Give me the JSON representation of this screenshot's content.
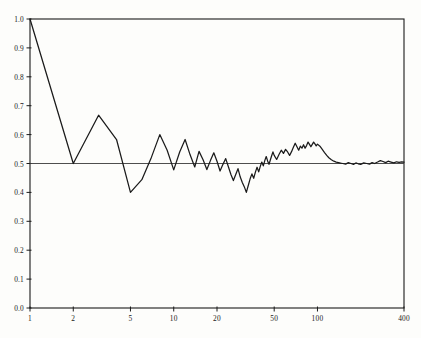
{
  "chart_data": {
    "type": "line",
    "title": "",
    "subtitle": "",
    "xlabel": "",
    "ylabel": "",
    "xscale": "log",
    "yscale": "linear",
    "xlim": [
      1,
      400
    ],
    "ylim": [
      0.0,
      1.0
    ],
    "grid": false,
    "legend": null,
    "legend_position": "none",
    "line_color": "#1a1a1a",
    "reference_line": {
      "name": "limit-line",
      "orientation": "horizontal",
      "y": 0.5,
      "color": "#3a3a3a"
    },
    "xticks": [
      1,
      2,
      5,
      10,
      20,
      50,
      100,
      400
    ],
    "xtick_labels": [
      "1",
      "2",
      "5",
      "10",
      "20",
      "50",
      "100",
      "400"
    ],
    "yticks": [
      0.0,
      0.1,
      0.2,
      0.3,
      0.4,
      0.5,
      0.6,
      0.7,
      0.8,
      0.9,
      1.0
    ],
    "ytick_labels": [
      "0.0",
      "0.1",
      "0.2",
      "0.3",
      "0.4",
      "0.5",
      "0.6",
      "0.7",
      "0.8",
      "0.9",
      "1.0"
    ],
    "series": [
      {
        "name": "relative-frequency",
        "x": [
          1,
          2,
          3,
          4,
          5,
          6,
          7,
          8,
          9,
          10,
          11,
          12,
          13,
          14,
          15,
          16,
          17,
          18,
          19,
          20,
          21,
          22,
          23,
          24,
          25,
          26,
          27,
          28,
          29,
          30,
          31,
          32,
          33,
          34,
          35,
          36,
          37,
          38,
          39,
          40,
          41,
          42,
          43,
          44,
          45,
          46,
          47,
          48,
          49,
          50,
          52,
          54,
          56,
          58,
          60,
          62,
          64,
          66,
          68,
          70,
          72,
          74,
          76,
          78,
          80,
          82,
          84,
          86,
          88,
          90,
          92,
          94,
          96,
          98,
          100,
          104,
          108,
          112,
          116,
          120,
          125,
          130,
          135,
          140,
          145,
          150,
          157,
          164,
          171,
          178,
          185,
          192,
          200,
          210,
          220,
          230,
          240,
          250,
          262,
          274,
          286,
          298,
          310,
          325,
          340,
          355,
          370,
          385,
          400
        ],
        "y": [
          1.0,
          0.5,
          0.667,
          0.583,
          0.4,
          0.444,
          0.522,
          0.6,
          0.546,
          0.478,
          0.54,
          0.583,
          0.53,
          0.488,
          0.542,
          0.513,
          0.479,
          0.51,
          0.537,
          0.508,
          0.474,
          0.497,
          0.517,
          0.489,
          0.462,
          0.441,
          0.462,
          0.482,
          0.454,
          0.434,
          0.419,
          0.4,
          0.424,
          0.447,
          0.464,
          0.449,
          0.47,
          0.487,
          0.471,
          0.49,
          0.505,
          0.492,
          0.51,
          0.524,
          0.509,
          0.497,
          0.512,
          0.527,
          0.54,
          0.528,
          0.514,
          0.531,
          0.546,
          0.535,
          0.549,
          0.54,
          0.528,
          0.541,
          0.556,
          0.57,
          0.558,
          0.546,
          0.56,
          0.553,
          0.565,
          0.553,
          0.562,
          0.574,
          0.566,
          0.558,
          0.566,
          0.574,
          0.568,
          0.561,
          0.567,
          0.56,
          0.549,
          0.538,
          0.528,
          0.52,
          0.513,
          0.508,
          0.505,
          0.503,
          0.501,
          0.5,
          0.498,
          0.503,
          0.5,
          0.497,
          0.502,
          0.499,
          0.497,
          0.502,
          0.5,
          0.498,
          0.503,
          0.5,
          0.505,
          0.51,
          0.507,
          0.503,
          0.508,
          0.505,
          0.502,
          0.506,
          0.504,
          0.506,
          0.505
        ]
      }
    ],
    "annotations": []
  }
}
